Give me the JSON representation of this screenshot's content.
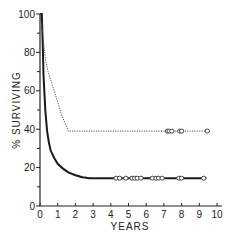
{
  "chart_data": {
    "type": "line",
    "title": "",
    "xlabel": "YEARS",
    "ylabel": "% SURVIVING",
    "xlim": [
      0,
      10
    ],
    "ylim": [
      0,
      100
    ],
    "xticks": [
      0,
      1,
      2,
      3,
      4,
      5,
      6,
      7,
      8,
      9,
      10
    ],
    "yticks": [
      0,
      20,
      40,
      60,
      80,
      100
    ],
    "grid": false,
    "legend": null,
    "series": [
      {
        "name": "solid curve",
        "style": "solid",
        "color": "#1a1a1a",
        "x": [
          0,
          0.1,
          0.15,
          0.2,
          0.3,
          0.4,
          0.5,
          0.6,
          0.8,
          1.0,
          1.3,
          1.6,
          2.0,
          2.4,
          2.8,
          3.5,
          4.0,
          5.0,
          6.0,
          7.0,
          8.0,
          9.4
        ],
        "y": [
          100,
          100,
          85,
          68,
          50,
          39,
          33,
          29,
          25,
          22,
          19.5,
          17.5,
          16,
          15,
          14.5,
          14.5,
          14.5,
          14.5,
          14.5,
          14.5,
          14.5,
          14.5
        ],
        "censored_x": [
          4.3,
          4.5,
          4.85,
          5.2,
          5.35,
          5.5,
          5.7,
          6.35,
          6.55,
          6.7,
          6.9,
          7.85,
          8.0,
          9.25
        ]
      },
      {
        "name": "dotted curve",
        "style": "dotted",
        "color": "#555555",
        "x": [
          0,
          0.15,
          0.3,
          0.45,
          0.8,
          1.2,
          1.6,
          3.0,
          5.0,
          7.0,
          9.4
        ],
        "y": [
          100,
          90,
          77,
          70,
          60,
          48,
          39,
          39,
          39,
          39,
          39
        ],
        "censored_x": [
          7.2,
          7.3,
          7.45,
          7.9,
          8.0,
          9.45
        ]
      }
    ]
  }
}
